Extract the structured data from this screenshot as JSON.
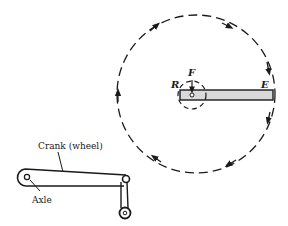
{
  "diagram": {
    "type": "lever / crank rotation illustration",
    "labels": {
      "fulcrum": "F",
      "resistance": "R",
      "effort": "E",
      "crank": "Crank (wheel)",
      "axle": "Axle"
    },
    "colors": {
      "ink": "#1a1a1a",
      "bar_fill": "#d9d9d9",
      "background": "#ffffff"
    },
    "large_circle": {
      "cx": 196,
      "cy": 94,
      "r": 79,
      "style": "dashed",
      "direction": "clockwise",
      "arrows": 6
    },
    "small_circle": {
      "cx": 192,
      "cy": 95,
      "r": 14,
      "style": "dashed"
    },
    "bar": {
      "x1": 180,
      "x2": 273,
      "y1": 90,
      "y2": 100
    }
  }
}
